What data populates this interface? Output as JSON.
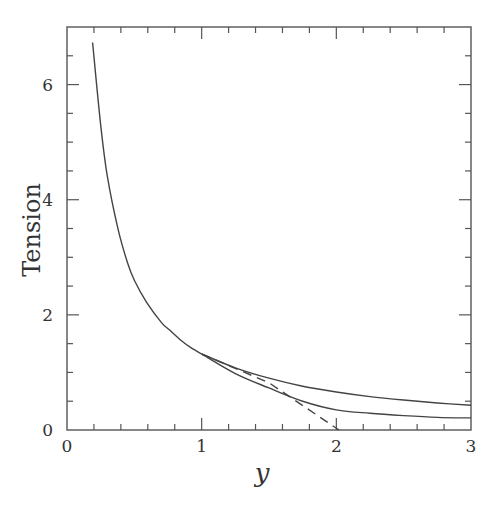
{
  "chart_data": {
    "type": "line",
    "title": "",
    "xlabel": "y",
    "ylabel": "Tension",
    "xlim": [
      0,
      3
    ],
    "ylim": [
      0,
      7
    ],
    "grid": false,
    "legend": null,
    "x_ticks": [
      0,
      1,
      2,
      3
    ],
    "x_tick_labels": [
      "0",
      "1",
      "2",
      "3"
    ],
    "x_minor_step": 0.2,
    "y_ticks": [
      0,
      2,
      4,
      6
    ],
    "y_tick_labels": [
      "0",
      "2",
      "4",
      "6"
    ],
    "y_minor_step": 0.5,
    "series": [
      {
        "name": "main-branch",
        "style": "solid",
        "x": [
          0.19,
          0.25,
          0.3,
          0.38,
          0.45,
          0.5,
          0.59,
          0.7,
          0.76,
          0.85,
          0.92,
          1.0
        ],
        "values": [
          6.73,
          5.3,
          4.4,
          3.48,
          2.9,
          2.6,
          2.22,
          1.87,
          1.74,
          1.55,
          1.43,
          1.32
        ]
      },
      {
        "name": "upper-branch",
        "style": "solid",
        "x": [
          1.0,
          1.25,
          1.5,
          1.75,
          2.0,
          2.25,
          2.5,
          2.75,
          3.0
        ],
        "values": [
          1.32,
          1.08,
          0.9,
          0.76,
          0.66,
          0.58,
          0.52,
          0.47,
          0.43
        ]
      },
      {
        "name": "lower-branch",
        "style": "solid",
        "x": [
          1.0,
          1.25,
          1.5,
          1.75,
          2.0,
          2.25,
          2.5,
          2.75,
          3.0
        ],
        "values": [
          1.32,
          0.98,
          0.73,
          0.5,
          0.35,
          0.29,
          0.25,
          0.22,
          0.21
        ]
      },
      {
        "name": "dashed-line",
        "style": "dashed",
        "x": [
          1.0,
          1.5,
          2.02
        ],
        "values": [
          1.32,
          0.82,
          0.0
        ]
      }
    ]
  },
  "colors": {
    "axis": "#555555",
    "line": "#444444",
    "text": "#333333"
  }
}
